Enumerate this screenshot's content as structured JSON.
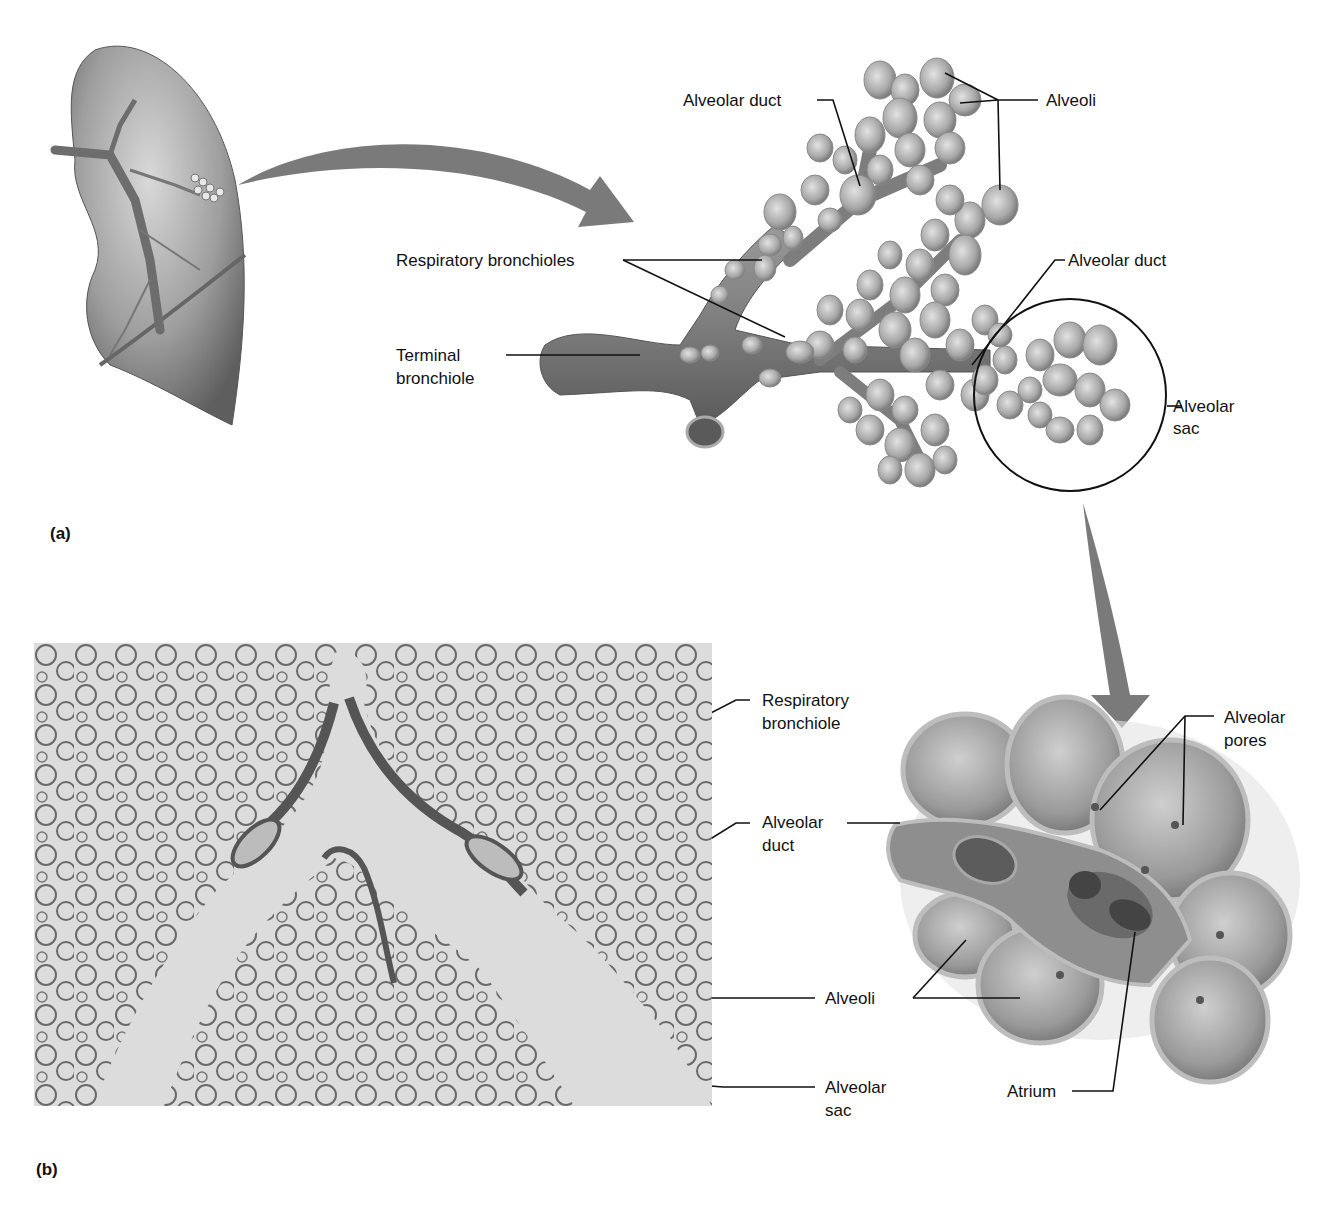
{
  "figure": {
    "panels": [
      {
        "id": "a",
        "label": "(a)",
        "description": "Illustration of lung with enlarged respiratory zone structures",
        "labels": {
          "alveolar_duct_top": "Alveolar duct",
          "alveoli_top": "Alveoli",
          "respiratory_bronchioles": "Respiratory bronchioles",
          "alveolar_duct_right": "Alveolar duct",
          "terminal_bronchiole_line1": "Terminal",
          "terminal_bronchiole_line2": "bronchiole",
          "alveolar_sac_line1": "Alveolar",
          "alveolar_sac_line2": "sac"
        }
      },
      {
        "id": "b",
        "label": "(b)",
        "description": "Light micrograph of lung tissue and cutaway of alveolar sac",
        "labels": {
          "respiratory_bronchiole_line1": "Respiratory",
          "respiratory_bronchiole_line2": "bronchiole",
          "alveolar_duct_line1": "Alveolar",
          "alveolar_duct_line2": "duct",
          "alveoli": "Alveoli",
          "alveolar_sac_line1": "Alveolar",
          "alveolar_sac_line2": "sac",
          "alveolar_pores_line1": "Alveolar",
          "alveolar_pores_line2": "pores",
          "atrium": "Atrium"
        }
      }
    ],
    "colors": {
      "background": "#ffffff",
      "tissue_gray": "#8c8c8c",
      "arrow_gray": "#7a7a7a",
      "leader_line": "#111111",
      "micrograph_bg": "#dcdcdc"
    }
  }
}
